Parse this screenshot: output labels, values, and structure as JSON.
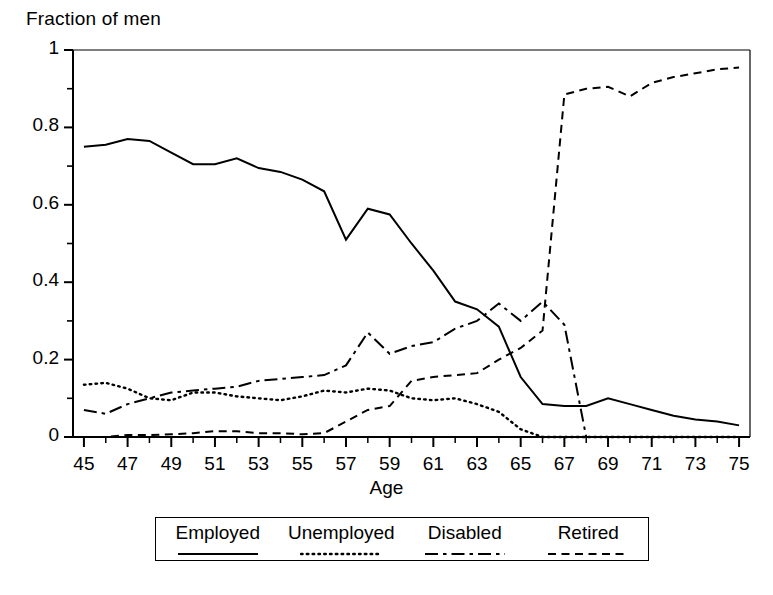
{
  "chart_data": {
    "type": "line",
    "title": "",
    "ylabel": "Fraction of men",
    "xlabel": "Age",
    "xlim": [
      44.5,
      75.5
    ],
    "ylim": [
      0,
      1
    ],
    "grid": false,
    "legend_position": "bottom",
    "y_ticks": [
      "0",
      "0.2",
      "0.4",
      "0.6",
      "0.8",
      "1"
    ],
    "y_tick_values": [
      0,
      0.2,
      0.4,
      0.6,
      0.8,
      1
    ],
    "y_minor_tick_values": [
      0.1,
      0.3,
      0.5,
      0.7,
      0.9
    ],
    "x_ticks": [
      "45",
      "47",
      "49",
      "51",
      "53",
      "55",
      "57",
      "59",
      "61",
      "63",
      "65",
      "67",
      "69",
      "71",
      "73",
      "75"
    ],
    "x_tick_values": [
      45,
      47,
      49,
      51,
      53,
      55,
      57,
      59,
      61,
      63,
      65,
      67,
      69,
      71,
      73,
      75
    ],
    "x": [
      45,
      46,
      47,
      48,
      49,
      50,
      51,
      52,
      53,
      54,
      55,
      56,
      57,
      58,
      59,
      60,
      61,
      62,
      63,
      64,
      65,
      66,
      67,
      68,
      69,
      70,
      71,
      72,
      73,
      74,
      75
    ],
    "series": [
      {
        "name": "Employed",
        "style": "solid",
        "color": "#000000",
        "values": [
          0.75,
          0.755,
          0.77,
          0.765,
          0.735,
          0.705,
          0.705,
          0.72,
          0.695,
          0.685,
          0.665,
          0.635,
          0.51,
          0.59,
          0.575,
          0.5,
          0.43,
          0.35,
          0.33,
          0.285,
          0.155,
          0.085,
          0.08,
          0.08,
          0.1,
          0.085,
          0.07,
          0.055,
          0.045,
          0.04,
          0.03
        ]
      },
      {
        "name": "Unemployed",
        "style": "dotted",
        "color": "#000000",
        "values": [
          0.135,
          0.14,
          0.125,
          0.1,
          0.095,
          0.115,
          0.115,
          0.105,
          0.1,
          0.095,
          0.105,
          0.12,
          0.115,
          0.125,
          0.12,
          0.1,
          0.095,
          0.1,
          0.085,
          0.065,
          0.02,
          0.0,
          0.0,
          0.0,
          0.0,
          0.0,
          0.0,
          0.0,
          0.0,
          0.0,
          0.0
        ]
      },
      {
        "name": "Disabled",
        "style": "dash-dot",
        "color": "#000000",
        "values": [
          0.07,
          0.06,
          0.085,
          0.1,
          0.115,
          0.12,
          0.125,
          0.13,
          0.145,
          0.15,
          0.155,
          0.16,
          0.185,
          0.27,
          0.215,
          0.235,
          0.245,
          0.28,
          0.3,
          0.345,
          0.3,
          0.35,
          0.29,
          0.0,
          null,
          null,
          null,
          null,
          null,
          null,
          null
        ]
      },
      {
        "name": "Retired",
        "style": "dashed",
        "color": "#000000",
        "values": [
          0.0,
          0.0,
          0.005,
          0.005,
          0.007,
          0.01,
          0.015,
          0.015,
          0.01,
          0.01,
          0.007,
          0.01,
          0.04,
          0.07,
          0.08,
          0.145,
          0.155,
          0.16,
          0.165,
          0.2,
          0.23,
          0.275,
          0.885,
          0.9,
          0.905,
          0.88,
          0.915,
          0.93,
          0.94,
          0.95,
          0.955
        ]
      }
    ]
  },
  "legend": {
    "entries": [
      {
        "label": "Employed",
        "style": "solid"
      },
      {
        "label": "Unemployed",
        "style": "dotted"
      },
      {
        "label": "Disabled",
        "style": "dash-dot"
      },
      {
        "label": "Retired",
        "style": "dashed"
      }
    ]
  }
}
